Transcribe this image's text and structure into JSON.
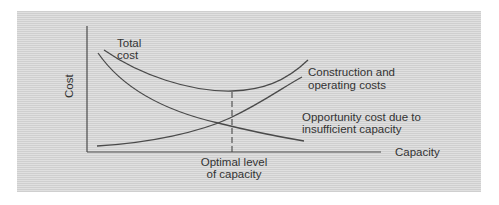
{
  "diagram": {
    "y_axis_label": "Cost",
    "x_axis_label": "Capacity",
    "curves": {
      "total": {
        "label_line1": "Total",
        "label_line2": "cost"
      },
      "construction": {
        "label_line1": "Construction and",
        "label_line2": "operating costs"
      },
      "opportunity": {
        "label_line1": "Opportunity cost due to",
        "label_line2": "insufficient capacity"
      }
    },
    "optimal": {
      "label_line1": "Optimal level",
      "label_line2": "of capacity"
    },
    "colors": {
      "line": "#4a4a4a",
      "background": "#d6d6d6"
    }
  }
}
